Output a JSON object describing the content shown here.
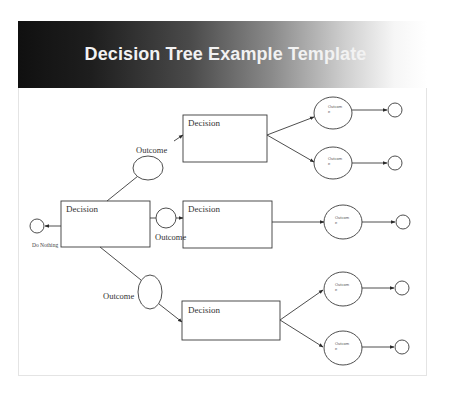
{
  "header": {
    "title": "Decision Tree Example Template"
  },
  "tree": {
    "root": {
      "label": "Decision",
      "terminal_label": "Do Nothing"
    },
    "branches": [
      {
        "outcome_label": "Outcome",
        "decision_label": "Decision",
        "leaves": [
          {
            "label": "Outcom e"
          },
          {
            "label": "Outcom e"
          }
        ]
      },
      {
        "outcome_label": "Outcome",
        "decision_label": "Decision",
        "leaves": [
          {
            "label": "Outcom e"
          }
        ]
      },
      {
        "outcome_label": "Outcome",
        "decision_label": "Decision",
        "leaves": [
          {
            "label": "Outcom e"
          },
          {
            "label": "Outcom e"
          }
        ]
      }
    ]
  },
  "colors": {
    "stroke": "#3a3a3a",
    "header_dark": "#101010",
    "header_light": "#ffffff",
    "title_text": "#f2f2f2"
  }
}
